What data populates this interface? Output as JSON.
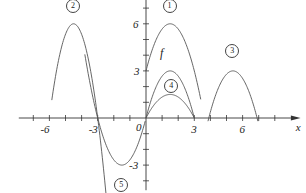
{
  "figure": {
    "background": "#ffffff",
    "curve_color": "#555555",
    "axis_color": "#333333",
    "text_color": "#222222"
  },
  "axes": {
    "x_axis_label": "x",
    "y_axis_label": "y",
    "origin_label": "0",
    "x_tick_labels": [
      "-6",
      "-3",
      "6"
    ],
    "x_tick_values": [
      -6,
      -3,
      6
    ],
    "y_tick_labels": [
      "6",
      "3",
      "-3"
    ],
    "y_tick_values": [
      6,
      3,
      -3
    ],
    "x_minor_tick_values": [
      -7,
      -6,
      -5,
      -4,
      -3,
      -2,
      -1,
      1,
      2,
      3,
      4,
      5,
      6,
      7,
      8
    ],
    "y_minor_tick_values": [
      7,
      6,
      5,
      4,
      3,
      2,
      1,
      -1,
      -2,
      -3,
      -4
    ],
    "three_label": "3",
    "three_value": 3
  },
  "curve_labels": [
    {
      "id": "tag-1",
      "text": "1",
      "x": 1.4,
      "y": 7.2
    },
    {
      "id": "tag-2",
      "text": "2",
      "x": -4.6,
      "y": 7.2
    },
    {
      "id": "tag-3",
      "text": "3",
      "x": 5.3,
      "y": 4.3
    },
    {
      "id": "tag-4",
      "text": "4",
      "x": 1.5,
      "y": 2.1
    },
    {
      "id": "tag-5",
      "text": "5",
      "x": -1.6,
      "y": -4.2
    },
    {
      "id": "tag-f",
      "text": "f",
      "x": 1.0,
      "y": 4.1
    }
  ],
  "chart_data": {
    "type": "line",
    "title": "",
    "xlabel": "x",
    "ylabel": "y",
    "xlim": [
      -7.5,
      8.7
    ],
    "ylim": [
      -4.8,
      7.8
    ],
    "grid": false,
    "legend": "none",
    "series": [
      {
        "name": "f",
        "label": "f",
        "form": "downward parabola through (0,0) and (3,0), vertex (1.5, 3)",
        "vertex": [
          1.5,
          3
        ],
        "roots": [
          0,
          3
        ],
        "a": -1.3333,
        "x_start": 0,
        "x_end": 3
      },
      {
        "name": "curve-1",
        "label": "1",
        "form": "f shifted up by 3: vertex (1.5, 6)",
        "vertex": [
          1.5,
          6
        ],
        "roots": [
          -3,
          3
        ],
        "a": -1.3333,
        "x_start": 0,
        "x_end": 3.4
      },
      {
        "name": "curve-2",
        "label": "2",
        "form": "f shifted left by 6: vertex (-4.5, 6) scaled, roots at -6 and -3",
        "vertex": [
          -4.5,
          6
        ],
        "roots": [
          -6,
          -3
        ],
        "a": -2.6667,
        "x_start": -5.85,
        "x_end": -2.45
      },
      {
        "name": "curve-3",
        "label": "3",
        "form": "f shifted right by 4: vertex (5.5, 3), roots at 4 and 7",
        "vertex": [
          5.4,
          3
        ],
        "roots": [
          3.85,
          6.95
        ],
        "a": -1.3333,
        "x_start": 3.85,
        "x_end": 6.95
      },
      {
        "name": "curve-4",
        "label": "4",
        "form": "f vertically compressed: vertex (1.5, 1.5)",
        "vertex": [
          1.5,
          1.5
        ],
        "roots": [
          0,
          3
        ],
        "a": -0.6667,
        "x_start": 0,
        "x_end": 3
      },
      {
        "name": "curve-5",
        "label": "5",
        "form": "f reflected: upward parabola vertex (-1.5, -3), roots at -3 and 0",
        "vertex": [
          -1.5,
          -3
        ],
        "roots": [
          -3,
          0
        ],
        "a": 1.3333,
        "x_start": -3.8,
        "x_end": -0.05
      }
    ]
  }
}
